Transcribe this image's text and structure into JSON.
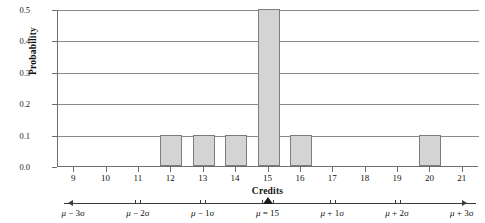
{
  "chart_data": {
    "type": "bar",
    "title": "",
    "xlabel": "Credits",
    "ylabel": "Probability",
    "categories": [
      9,
      10,
      11,
      12,
      13,
      14,
      15,
      16,
      17,
      18,
      19,
      20,
      21
    ],
    "values": [
      0.0,
      0.0,
      0.0,
      0.1,
      0.1,
      0.1,
      0.5,
      0.1,
      0.0,
      0.0,
      0.0,
      0.1,
      0.0
    ],
    "xlim": [
      8.5,
      21.5
    ],
    "ylim": [
      0.0,
      0.5
    ],
    "y_ticks": [
      0.0,
      0.1,
      0.2,
      0.3,
      0.4,
      0.5
    ],
    "y_tick_labels": [
      "0.0",
      "0.1",
      "0.2",
      "0.3",
      "0.4",
      "0.5"
    ],
    "x_ticks": [
      9,
      10,
      11,
      12,
      13,
      14,
      15,
      16,
      17,
      18,
      19,
      20,
      21
    ],
    "x_tick_labels": [
      "9",
      "10",
      "11",
      "12",
      "13",
      "14",
      "15",
      "16",
      "17",
      "18",
      "19",
      "20",
      "21"
    ],
    "grid": "horizontal",
    "legend": "none",
    "bar_fill_color": "#d4d4d4",
    "bar_edge_color": "#7d7d7d",
    "axis_color": "#6e6e6e",
    "grid_color": "#8a8a8a",
    "annotations": {
      "mean": 15,
      "sigma": 2,
      "mu_marker_label": "μ = 15",
      "sigma_axis_labels": [
        {
          "x": 9,
          "label": "μ − 3σ"
        },
        {
          "x": 11,
          "label": "μ − 2σ"
        },
        {
          "x": 13,
          "label": "μ − 1σ"
        },
        {
          "x": 17,
          "label": "μ + 1σ"
        },
        {
          "x": 19,
          "label": "μ + 2σ"
        },
        {
          "x": 21,
          "label": "μ + 3σ"
        }
      ]
    }
  }
}
